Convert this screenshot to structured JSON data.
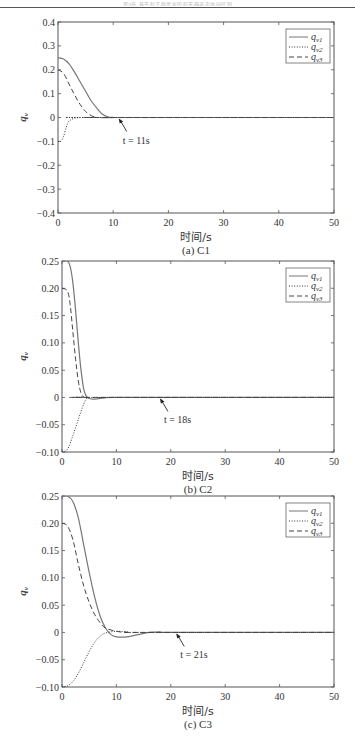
{
  "header": {
    "text": "第9章 基于粒子群优化的航天器姿态协同控制"
  },
  "chart_data": [
    {
      "type": "line",
      "panel": "a",
      "caption": "(a) C1",
      "xlabel": "时间/s",
      "ylabel": "q_v",
      "xlim": [
        0,
        50
      ],
      "ylim": [
        -0.4,
        0.4
      ],
      "xticks": [
        "0",
        "10",
        "20",
        "30",
        "40",
        "50"
      ],
      "yticks": [
        "0.4",
        "0.3",
        "0.2",
        "0.1",
        "0",
        "-0.1",
        "-0.2",
        "-0.3",
        "-0.4"
      ],
      "grid": false,
      "legend_position": "upper right",
      "legend": [
        {
          "label": "q",
          "sub": "v1",
          "style": "solid"
        },
        {
          "label": "q",
          "sub": "v2",
          "style": "dotted"
        },
        {
          "label": "q",
          "sub": "v3",
          "style": "dashed"
        }
      ],
      "annotation": {
        "text": "t = 11s",
        "x": 11,
        "y": 0
      },
      "series": [
        {
          "name": "q_v1",
          "style": "solid",
          "x": [
            0,
            1,
            2,
            3,
            4,
            5,
            6,
            7,
            8,
            9,
            10,
            11,
            50
          ],
          "y": [
            0.25,
            0.245,
            0.225,
            0.19,
            0.15,
            0.11,
            0.07,
            0.04,
            0.015,
            0.003,
            0,
            0,
            0
          ]
        },
        {
          "name": "q_v2",
          "style": "dotted",
          "x": [
            0,
            0.5,
            1,
            1.5,
            2,
            3,
            4,
            5,
            50
          ],
          "y": [
            -0.1,
            -0.1,
            -0.08,
            -0.04,
            -0.015,
            -0.003,
            0,
            0,
            0
          ]
        },
        {
          "name": "q_v3",
          "style": "dashed",
          "x": [
            0,
            1,
            2,
            3,
            4,
            5,
            6,
            7,
            8,
            50
          ],
          "y": [
            0.2,
            0.185,
            0.14,
            0.095,
            0.055,
            0.025,
            0.008,
            0.001,
            0,
            0
          ]
        }
      ]
    },
    {
      "type": "line",
      "panel": "b",
      "caption": "(b) C2",
      "xlabel": "时间/s",
      "ylabel": "q_v",
      "xlim": [
        0,
        50
      ],
      "ylim": [
        -0.1,
        0.25
      ],
      "xticks": [
        "0",
        "10",
        "20",
        "30",
        "40",
        "50"
      ],
      "yticks": [
        "0.25",
        "0.20",
        "0.15",
        "0.10",
        "0.05",
        "0",
        "-0.05",
        "-0.10"
      ],
      "grid": false,
      "legend_position": "upper right",
      "legend": [
        {
          "label": "q",
          "sub": "v1",
          "style": "solid"
        },
        {
          "label": "q",
          "sub": "v2",
          "style": "dotted"
        },
        {
          "label": "q",
          "sub": "v3",
          "style": "dashed"
        }
      ],
      "annotation": {
        "text": "t = 18s",
        "x": 18,
        "y": 0
      },
      "series": [
        {
          "name": "q_v1",
          "style": "solid",
          "x": [
            0,
            1,
            1.5,
            2,
            2.5,
            3,
            3.5,
            4,
            4.5,
            5,
            6,
            8,
            10,
            50
          ],
          "y": [
            0.25,
            0.25,
            0.24,
            0.21,
            0.16,
            0.1,
            0.05,
            0.015,
            0.002,
            -0.002,
            -0.003,
            -0.001,
            0,
            0
          ]
        },
        {
          "name": "q_v2",
          "style": "dotted",
          "x": [
            0,
            1,
            2,
            3,
            4,
            4.5,
            5,
            6,
            50
          ],
          "y": [
            -0.1,
            -0.095,
            -0.07,
            -0.04,
            -0.012,
            -0.002,
            0,
            0,
            0
          ]
        },
        {
          "name": "q_v3",
          "style": "dashed",
          "x": [
            0,
            1,
            1.5,
            2,
            2.5,
            3,
            3.5,
            4,
            5,
            50
          ],
          "y": [
            0.2,
            0.195,
            0.17,
            0.12,
            0.07,
            0.03,
            0.008,
            0.001,
            0,
            0
          ]
        }
      ]
    },
    {
      "type": "line",
      "panel": "c",
      "caption": "(c) C3",
      "xlabel": "时间/s",
      "ylabel": "q_v",
      "xlim": [
        0,
        50
      ],
      "ylim": [
        -0.1,
        0.25
      ],
      "xticks": [
        "0",
        "10",
        "20",
        "30",
        "40",
        "50"
      ],
      "yticks": [
        "0.25",
        "0.20",
        "0.15",
        "0.10",
        "0.05",
        "0",
        "-0.05",
        "-0.10"
      ],
      "grid": false,
      "legend_position": "upper right",
      "legend": [
        {
          "label": "q",
          "sub": "v1",
          "style": "solid"
        },
        {
          "label": "q",
          "sub": "v2",
          "style": "dotted"
        },
        {
          "label": "q",
          "sub": "v3",
          "style": "dashed"
        }
      ],
      "annotation": {
        "text": "t = 21s",
        "x": 21,
        "y": 0
      },
      "series": [
        {
          "name": "q_v1",
          "style": "solid",
          "x": [
            0,
            1,
            2,
            3,
            4,
            5,
            6,
            7,
            8,
            9,
            10,
            12,
            14,
            16,
            18,
            20,
            50
          ],
          "y": [
            0.25,
            0.25,
            0.24,
            0.21,
            0.16,
            0.11,
            0.065,
            0.03,
            0.008,
            -0.004,
            -0.008,
            -0.008,
            -0.004,
            0,
            0.001,
            0,
            0
          ]
        },
        {
          "name": "q_v2",
          "style": "dotted",
          "x": [
            0,
            1,
            2,
            3,
            4,
            5,
            6,
            7,
            8,
            10,
            12,
            15,
            50
          ],
          "y": [
            -0.1,
            -0.098,
            -0.09,
            -0.075,
            -0.055,
            -0.035,
            -0.018,
            -0.007,
            -0.001,
            0.002,
            0.001,
            0,
            0
          ]
        },
        {
          "name": "q_v3",
          "style": "dashed",
          "x": [
            0,
            1,
            2,
            3,
            4,
            5,
            6,
            7,
            8,
            10,
            12,
            15,
            50
          ],
          "y": [
            0.2,
            0.195,
            0.17,
            0.125,
            0.085,
            0.055,
            0.033,
            0.018,
            0.008,
            0.002,
            0,
            0,
            0
          ]
        }
      ]
    }
  ],
  "panels": [
    {
      "xlabel": "时间/s",
      "caption": "(a) C1",
      "annotation": "t = 11s"
    },
    {
      "xlabel": "时间/s",
      "caption": "(b) C2",
      "annotation": "t = 18s"
    },
    {
      "xlabel": "时间/s",
      "caption": "(c) C3",
      "annotation": "t = 21s"
    }
  ]
}
